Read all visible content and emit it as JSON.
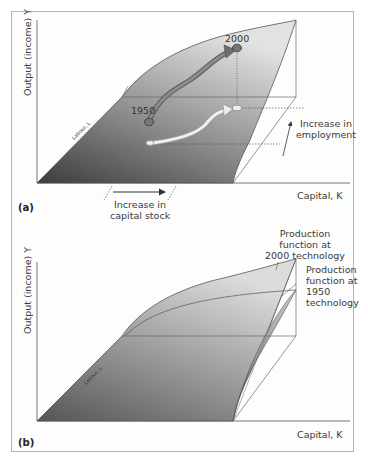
{
  "figure": {
    "panels": [
      {
        "id": "a",
        "label": "(a)",
        "y_axis_label": "Output (income) Y",
        "x_axis_label": "Capital, K",
        "depth_axis_label": "Labour, L",
        "annotations": {
          "year_start": "1950",
          "year_end": "2000",
          "capital_arrow_line1": "Increase in",
          "capital_arrow_line2": "capital stock",
          "employment_arrow_line1": "Increase in",
          "employment_arrow_line2": "employment"
        }
      },
      {
        "id": "b",
        "label": "(b)",
        "y_axis_label": "Output (income) Y",
        "x_axis_label": "Capital, K",
        "depth_axis_label": "Labour, L",
        "annotations": {
          "pf2000_line1": "Production",
          "pf2000_line2": "function at",
          "pf2000_line3": "2000 technology",
          "pf1950_line1": "Production",
          "pf1950_line2": "function at",
          "pf1950_line3": "1950",
          "pf1950_line4": "technology"
        }
      }
    ],
    "colors": {
      "surface_dark": "#4a4a4a",
      "surface_light": "#d8d8d8",
      "arrow_2000": "#6e6e6e",
      "arrow_projection": "#e8e8e8",
      "frame": "#b5b5b5"
    }
  }
}
